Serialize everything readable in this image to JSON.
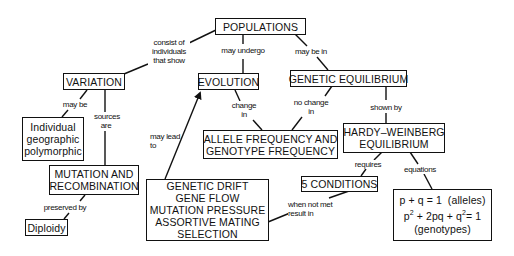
{
  "nodes": {
    "populations": "POPULATIONS",
    "variation": "VARIATION",
    "evolution": "EVOLUTION",
    "genetic_equilibrium": "GENETIC EQUILIBRIUM",
    "variation_types": [
      "Individual",
      "geographic",
      "polymorphic"
    ],
    "allele_frequency": [
      "ALLELE FREQUENCY AND",
      "GENOTYPE FREQUENCY"
    ],
    "hardy_weinberg": [
      "HARDY–WEINBERG",
      "EQUILIBRIUM"
    ],
    "mutation_recombination": [
      "MUTATION AND",
      "RECOMBINATION"
    ],
    "five_conditions": "5 CONDITIONS",
    "forces": [
      "GENETIC DRIFT",
      "GENE FLOW",
      "MUTATION PRESSURE",
      "ASSORTIVE MATING",
      "SELECTION"
    ],
    "diploidy": "Diploidy",
    "equations": {
      "line1": "p + q = 1  (alleles)",
      "line2_p": "p",
      "line2_sup1": "2",
      "line2_mid": " + 2pq + q",
      "line2_sup2": "2",
      "line2_end": "= 1",
      "line3": "(genotypes)"
    }
  },
  "links": {
    "consist_of": [
      "consist of",
      "individuals",
      "that show"
    ],
    "may_undergo": "may undergo",
    "may_be_in": "may be in",
    "may_be": "may be",
    "sources_are": [
      "sources",
      "are"
    ],
    "change_in": [
      "change",
      "in"
    ],
    "no_change_in": [
      "no change",
      "in"
    ],
    "shown_by": "shown by",
    "may_lead_to": [
      "may lead",
      "to"
    ],
    "requires": "requires",
    "equations": "equations",
    "preserved_by": "preserved by",
    "when_not_met": [
      "when not met",
      "result in"
    ]
  }
}
